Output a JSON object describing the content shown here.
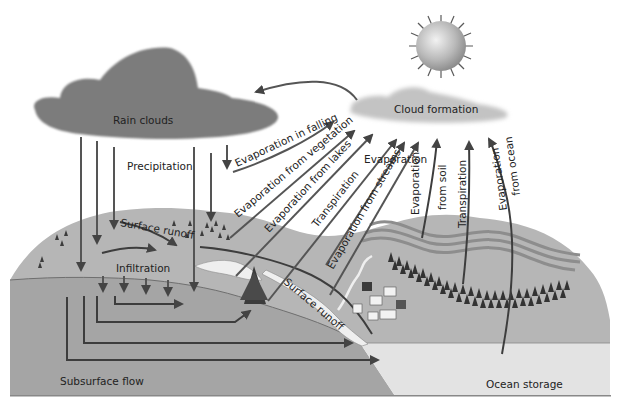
{
  "diagram": {
    "colors": {
      "background": "#ffffff",
      "land": "#b4b4b4",
      "land_dark": "#a3a3a3",
      "subsurface": "#a8a8a8",
      "ocean": "#e2e2e2",
      "rain_cloud": "#7a7a7a",
      "formation_cloud": "#bdbdbd",
      "sun": "#bcbcbc",
      "arrow": "#4a4a4a",
      "stream": "#efefef",
      "trees": "#3a3a3a"
    },
    "nodes": {
      "rain_clouds": "Rain clouds",
      "cloud_formation": "Cloud formation",
      "sun": "Sun",
      "ocean_storage": "Ocean storage",
      "subsurface_flow": "Subsurface flow"
    },
    "labels": {
      "precipitation": "Precipitation",
      "surface_runoff_upper": "Surface runoff",
      "infiltration": "Infiltration",
      "surface_runoff_lower": "Surface runoff",
      "evaporation_in_falling": "Evaporation in falling",
      "evaporation_from_vegetation": "Evaporation from vegetation",
      "evaporation_from_lakes": "Evaporation from lakes",
      "transpiration_left": "Transpiration",
      "evaporation": "Evaporation",
      "evaporation_from_streams": "Evaporation from streams",
      "evaporation_from_soil_1": "Evaporation",
      "evaporation_from_soil_2": "from soil",
      "transpiration_right": "Transpiration",
      "evaporation_from_ocean_1": "Evaporation",
      "evaporation_from_ocean_2": "from ocean"
    },
    "edges": [
      {
        "from": "Cloud formation",
        "to": "Rain clouds"
      },
      {
        "from": "Rain clouds",
        "to": "Land",
        "label": "Precipitation"
      },
      {
        "from": "Falling rain",
        "to": "Cloud formation",
        "label": "Evaporation in falling"
      },
      {
        "from": "Vegetation",
        "to": "Cloud formation",
        "label": "Evaporation from vegetation"
      },
      {
        "from": "Lakes",
        "to": "Cloud formation",
        "label": "Evaporation from lakes"
      },
      {
        "from": "Trees",
        "to": "Cloud formation",
        "label": "Transpiration"
      },
      {
        "from": "Streams",
        "to": "Cloud formation",
        "label": "Evaporation from streams"
      },
      {
        "from": "Soil",
        "to": "Cloud formation",
        "label": "Evaporation from soil"
      },
      {
        "from": "Forest",
        "to": "Cloud formation",
        "label": "Transpiration"
      },
      {
        "from": "Ocean",
        "to": "Cloud formation",
        "label": "Evaporation from ocean"
      },
      {
        "from": "Land surface",
        "to": "Stream",
        "label": "Surface runoff"
      },
      {
        "from": "Surface",
        "to": "Groundwater",
        "label": "Infiltration"
      },
      {
        "from": "Groundwater",
        "to": "Ocean storage",
        "label": "Subsurface flow"
      }
    ]
  }
}
